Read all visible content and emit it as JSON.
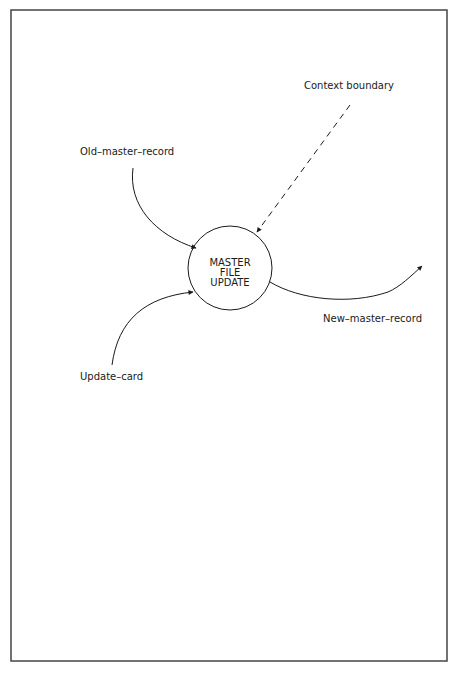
{
  "diagram": {
    "type": "context data flow diagram",
    "process": {
      "lines": [
        "MASTER",
        "FILE",
        "UPDATE"
      ]
    },
    "labels": {
      "context_boundary": "Context boundary",
      "old_master_record": "Old–master–record",
      "update_card": "Update–card",
      "new_master_record": "New–master–record"
    },
    "flows": [
      {
        "from": "Old-master-record",
        "to": "MASTER FILE UPDATE",
        "style": "solid"
      },
      {
        "from": "Update-card",
        "to": "MASTER FILE UPDATE",
        "style": "solid"
      },
      {
        "from": "MASTER FILE UPDATE",
        "to": "New-master-record",
        "style": "solid"
      },
      {
        "from": "Context boundary",
        "to": "MASTER FILE UPDATE",
        "style": "dashed"
      }
    ],
    "colors": {
      "ink": "#1a1a1a",
      "frame": "#444444",
      "background": "#ffffff"
    }
  }
}
